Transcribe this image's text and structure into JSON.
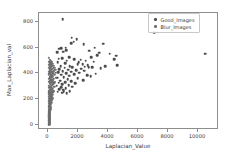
{
  "chart_data": {
    "type": "scatter",
    "title": "",
    "xlabel": "Laplacian_Value",
    "ylabel": "Max_Laplacian_val",
    "xlim": [
      -600,
      11400
    ],
    "ylim": [
      -40,
      870
    ],
    "xticks": [
      0,
      2000,
      4000,
      6000,
      8000,
      10000
    ],
    "yticks": [
      0,
      200,
      400,
      600,
      800
    ],
    "xticklabels": [
      "0",
      "2000",
      "4000",
      "6000",
      "8000",
      "10000"
    ],
    "yticklabels": [
      "0",
      "200",
      "400",
      "600",
      "800"
    ],
    "grid": false,
    "legend_position": "upper right",
    "series": [
      {
        "name": "Good_Images",
        "color": "#4c4c4c",
        "points": [
          [
            980,
            822
          ],
          [
            1580,
            678
          ],
          [
            1900,
            668
          ],
          [
            1700,
            648
          ],
          [
            1530,
            636
          ],
          [
            2380,
            628
          ],
          [
            3680,
            630
          ],
          [
            3100,
            600
          ],
          [
            1180,
            600
          ],
          [
            880,
            598
          ],
          [
            760,
            592
          ],
          [
            1230,
            582
          ],
          [
            2760,
            578
          ],
          [
            1020,
            568
          ],
          [
            620,
            566
          ],
          [
            3420,
            560
          ],
          [
            10480,
            552
          ],
          [
            7080,
            722
          ],
          [
            4120,
            552
          ],
          [
            4560,
            538
          ],
          [
            3280,
            540
          ],
          [
            2880,
            528
          ],
          [
            1400,
            524
          ],
          [
            930,
            520
          ],
          [
            700,
            514
          ],
          [
            1750,
            512
          ],
          [
            4420,
            512
          ],
          [
            2180,
            506
          ],
          [
            2520,
            500
          ],
          [
            1260,
            498
          ],
          [
            3060,
            492
          ],
          [
            2050,
            488
          ],
          [
            640,
            486
          ],
          [
            1130,
            480
          ],
          [
            1980,
            474
          ],
          [
            2300,
            470
          ],
          [
            2640,
            466
          ],
          [
            4600,
            462
          ],
          [
            3800,
            458
          ],
          [
            860,
            456
          ],
          [
            1460,
            454
          ],
          [
            2460,
            452
          ],
          [
            2720,
            450
          ],
          [
            2960,
            450
          ],
          [
            1620,
            448
          ],
          [
            1100,
            444
          ],
          [
            3520,
            440
          ],
          [
            2200,
            436
          ],
          [
            760,
            432
          ],
          [
            1340,
            430
          ],
          [
            1880,
            426
          ],
          [
            2420,
            422
          ],
          [
            980,
            418
          ],
          [
            1560,
            414
          ],
          [
            680,
            410
          ],
          [
            2080,
            406
          ],
          [
            1220,
            402
          ],
          [
            3180,
            398
          ],
          [
            1740,
            394
          ],
          [
            890,
            390
          ],
          [
            2600,
            386
          ],
          [
            1420,
            382
          ],
          [
            2860,
            378
          ],
          [
            1060,
            372
          ],
          [
            620,
            366
          ],
          [
            1980,
            362
          ],
          [
            1300,
            356
          ],
          [
            2360,
            348
          ],
          [
            820,
            344
          ],
          [
            1560,
            340
          ],
          [
            1140,
            334
          ],
          [
            700,
            328
          ],
          [
            1800,
            322
          ],
          [
            960,
            316
          ],
          [
            1380,
            310
          ],
          [
            580,
            304
          ],
          [
            1620,
            298
          ],
          [
            880,
            292
          ],
          [
            1180,
            286
          ],
          [
            760,
            278
          ],
          [
            1020,
            272
          ],
          [
            1440,
            264
          ],
          [
            660,
            258
          ],
          [
            940,
            250
          ],
          [
            1260,
            244
          ],
          [
            1060,
            262
          ]
        ]
      },
      {
        "name": "Blur_Images",
        "color": "#6e6e6e",
        "points": [
          [
            60,
            520
          ],
          [
            120,
            508
          ],
          [
            190,
            500
          ],
          [
            80,
            492
          ],
          [
            240,
            486
          ],
          [
            150,
            478
          ],
          [
            300,
            474
          ],
          [
            95,
            468
          ],
          [
            210,
            462
          ],
          [
            360,
            458
          ],
          [
            130,
            454
          ],
          [
            270,
            450
          ],
          [
            70,
            446
          ],
          [
            420,
            444
          ],
          [
            180,
            440
          ],
          [
            330,
            436
          ],
          [
            105,
            432
          ],
          [
            250,
            428
          ],
          [
            480,
            426
          ],
          [
            160,
            422
          ],
          [
            390,
            418
          ],
          [
            85,
            414
          ],
          [
            290,
            410
          ],
          [
            200,
            406
          ],
          [
            540,
            404
          ],
          [
            140,
            400
          ],
          [
            350,
            396
          ],
          [
            65,
            392
          ],
          [
            440,
            390
          ],
          [
            230,
            386
          ],
          [
            175,
            382
          ],
          [
            310,
            378
          ],
          [
            100,
            374
          ],
          [
            260,
            370
          ],
          [
            500,
            368
          ],
          [
            155,
            364
          ],
          [
            400,
            360
          ],
          [
            75,
            356
          ],
          [
            285,
            352
          ],
          [
            215,
            348
          ],
          [
            130,
            344
          ],
          [
            340,
            340
          ],
          [
            90,
            336
          ],
          [
            245,
            332
          ],
          [
            460,
            330
          ],
          [
            165,
            326
          ],
          [
            375,
            322
          ],
          [
            110,
            318
          ],
          [
            300,
            314
          ],
          [
            195,
            310
          ],
          [
            55,
            306
          ],
          [
            270,
            302
          ],
          [
            145,
            298
          ],
          [
            420,
            294
          ],
          [
            225,
            290
          ],
          [
            80,
            286
          ],
          [
            330,
            282
          ],
          [
            180,
            278
          ],
          [
            120,
            274
          ],
          [
            255,
            270
          ],
          [
            60,
            266
          ],
          [
            355,
            262
          ],
          [
            205,
            258
          ],
          [
            95,
            254
          ],
          [
            290,
            250
          ],
          [
            150,
            246
          ],
          [
            230,
            242
          ],
          [
            70,
            238
          ],
          [
            320,
            234
          ],
          [
            170,
            230
          ],
          [
            110,
            226
          ],
          [
            260,
            222
          ],
          [
            50,
            218
          ],
          [
            200,
            214
          ],
          [
            135,
            210
          ],
          [
            285,
            206
          ],
          [
            85,
            202
          ],
          [
            225,
            198
          ],
          [
            160,
            194
          ],
          [
            100,
            190
          ],
          [
            245,
            186
          ],
          [
            60,
            182
          ],
          [
            185,
            178
          ],
          [
            125,
            174
          ],
          [
            210,
            170
          ],
          [
            75,
            166
          ],
          [
            155,
            162
          ],
          [
            105,
            158
          ],
          [
            190,
            154
          ],
          [
            55,
            150
          ],
          [
            140,
            146
          ],
          [
            90,
            142
          ],
          [
            170,
            138
          ],
          [
            65,
            134
          ],
          [
            120,
            130
          ],
          [
            100,
            126
          ],
          [
            150,
            122
          ],
          [
            70,
            118
          ],
          [
            115,
            114
          ],
          [
            85,
            110
          ],
          [
            135,
            106
          ],
          [
            55,
            102
          ],
          [
            105,
            98
          ],
          [
            75,
            94
          ],
          [
            125,
            90
          ],
          [
            95,
            86
          ],
          [
            60,
            82
          ],
          [
            110,
            78
          ],
          [
            80,
            74
          ],
          [
            140,
            70
          ],
          [
            70,
            66
          ],
          [
            100,
            62
          ],
          [
            55,
            58
          ],
          [
            90,
            54
          ],
          [
            120,
            50
          ],
          [
            65,
            46
          ],
          [
            105,
            42
          ],
          [
            80,
            38
          ],
          [
            60,
            34
          ],
          [
            95,
            30
          ],
          [
            75,
            26
          ],
          [
            110,
            22
          ],
          [
            85,
            18
          ],
          [
            65,
            14
          ],
          [
            100,
            10
          ],
          [
            130,
            6
          ],
          [
            70,
            4
          ],
          [
            90,
            2
          ]
        ]
      }
    ]
  },
  "legend": {
    "entries": [
      {
        "label": "Good_Images"
      },
      {
        "label": "Blur_Images"
      }
    ]
  }
}
